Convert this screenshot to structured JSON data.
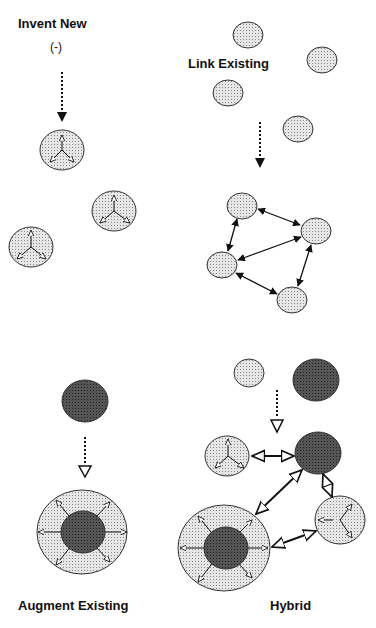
{
  "panels": {
    "invent_new": {
      "title": "Invent New",
      "subtitle": "(-)"
    },
    "link_existing": {
      "title": "Link Existing"
    },
    "augment_existing": {
      "title": "Augment Existing"
    },
    "hybrid": {
      "title": "Hybrid"
    }
  },
  "colors": {
    "light_fill": "#d9d9d9",
    "dark_fill": "#4a4a4a",
    "stroke": "#222222"
  }
}
